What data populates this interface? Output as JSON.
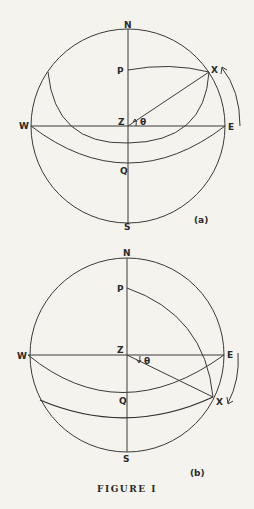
{
  "figure": {
    "caption": "FIGURE I",
    "panels": [
      {
        "id": "a",
        "tag": "(a)",
        "labels": {
          "N": "N",
          "S": "S",
          "E": "E",
          "W": "W",
          "Z": "Z",
          "P": "P",
          "Q": "Q",
          "X": "X",
          "theta": "θ"
        },
        "rotation_arrow": "counterclockwise-up"
      },
      {
        "id": "b",
        "tag": "(b)",
        "labels": {
          "N": "N",
          "S": "S",
          "E": "E",
          "W": "W",
          "Z": "Z",
          "P": "P",
          "Q": "Q",
          "X": "X",
          "theta": "θ"
        },
        "rotation_arrow": "clockwise-down"
      }
    ]
  },
  "colors": {
    "background": "#f4f3ee",
    "ink": "#2f2f2f"
  }
}
